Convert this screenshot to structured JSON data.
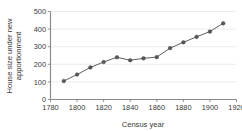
{
  "chart_data": {
    "type": "line",
    "title": "",
    "subtitle": "",
    "xlabel": "Census year",
    "ylabel": "House size under new apportionment",
    "ylabel_line1": "House size under new",
    "ylabel_line2": "apportionment",
    "x": [
      1790,
      1800,
      1810,
      1820,
      1830,
      1840,
      1850,
      1860,
      1870,
      1880,
      1890,
      1900,
      1910
    ],
    "values": [
      105,
      142,
      182,
      213,
      240,
      223,
      234,
      241,
      292,
      325,
      356,
      386,
      433
    ],
    "series": [
      {
        "name": "House size under new apportionment",
        "values": [
          105,
          142,
          182,
          213,
          240,
          223,
          234,
          241,
          292,
          325,
          356,
          386,
          433
        ]
      }
    ],
    "xlim": [
      1780,
      1920
    ],
    "ylim": [
      0,
      500
    ],
    "xticks": [
      1780,
      1800,
      1820,
      1840,
      1860,
      1880,
      1900,
      1920
    ],
    "xticklabels": [
      "1780",
      "1800",
      "1820",
      "1840",
      "1860",
      "1880",
      "1900",
      "1920"
    ],
    "yticks": [
      0,
      100,
      200,
      300,
      400,
      500
    ],
    "yticklabels": [
      "0",
      "100",
      "200",
      "300",
      "400",
      "500"
    ],
    "grid": "horizontal",
    "legend": "none",
    "marker": "circle",
    "line_color": "#58585a",
    "marker_color": "#58585a",
    "grid_color": "#e2e2e2",
    "axis_color": "#8a8a8a",
    "text_color": "#3a3a3a",
    "background_color": "#ffffff"
  }
}
